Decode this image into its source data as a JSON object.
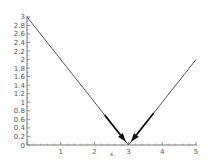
{
  "chart_data": {
    "type": "line",
    "title": "",
    "xlabel": "x",
    "ylabel": "",
    "xlim": [
      0,
      5
    ],
    "ylim": [
      0,
      3
    ],
    "grid": false,
    "legend": null,
    "x_ticks": [
      1,
      2,
      3,
      4,
      5
    ],
    "x_tick_labels": [
      "1",
      "2",
      "3",
      "4",
      "5"
    ],
    "y_ticks": [
      0,
      0.2,
      0.4,
      0.6,
      0.8,
      1,
      1.2,
      1.4,
      1.6,
      1.8,
      2,
      2.2,
      2.4,
      2.6,
      2.8,
      3
    ],
    "y_tick_labels": [
      "0",
      "0.2",
      "0.4",
      "0.6",
      "0.8",
      "1",
      "1.2",
      "1.4",
      "1.6",
      "1.8",
      "2",
      "2.2",
      "2.4",
      "2.6",
      "2.8",
      "3"
    ],
    "series": [
      {
        "name": "y = |x - 3|",
        "x": [
          0,
          3,
          5
        ],
        "y": [
          3,
          0,
          2
        ],
        "color": "#555555"
      }
    ],
    "annotations": [
      {
        "type": "arrow",
        "from": [
          2.3,
          0.7
        ],
        "to": [
          2.93,
          0.07
        ],
        "color": "#111111",
        "label": "left-limit-arrow"
      },
      {
        "type": "arrow",
        "from": [
          3.75,
          0.75
        ],
        "to": [
          3.07,
          0.07
        ],
        "color": "#111111",
        "label": "right-limit-arrow"
      }
    ]
  },
  "plot": {
    "origin_px": [
      27,
      145
    ],
    "x_unit_px": 33.8,
    "y_unit_px": 42.7,
    "axis_color": "#777777",
    "line_color": "#666666",
    "arrow_color": "#111111"
  }
}
